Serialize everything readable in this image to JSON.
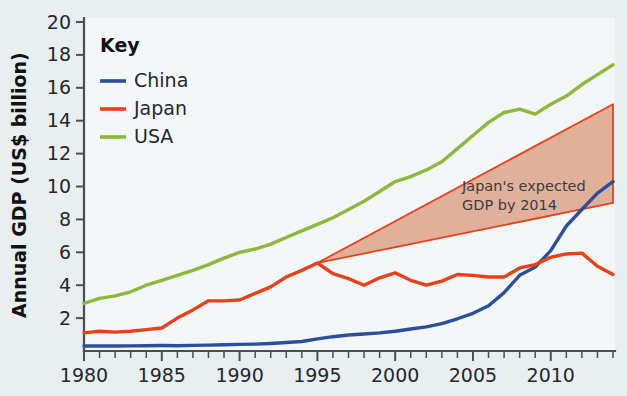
{
  "chart_data": {
    "type": "line",
    "title": "",
    "xlabel": "",
    "ylabel": "Annual GDP (US$ billion)",
    "xlim": [
      1980,
      2014
    ],
    "ylim": [
      0,
      20
    ],
    "grid": false,
    "legend_position": "top-left",
    "legend_title": "Key",
    "x_tick_labels": [
      "1980",
      "1985",
      "1990",
      "1995",
      "2000",
      "2005",
      "2010"
    ],
    "x_tick_values": [
      1980,
      1985,
      1990,
      1995,
      2000,
      2005,
      2010
    ],
    "x_minor_step": 1,
    "y_tick_labels": [
      "2",
      "4",
      "6",
      "8",
      "10",
      "12",
      "14",
      "16",
      "18",
      "20"
    ],
    "y_tick_values": [
      2,
      4,
      6,
      8,
      10,
      12,
      14,
      16,
      18,
      20
    ],
    "x": [
      1980,
      1981,
      1982,
      1983,
      1984,
      1985,
      1986,
      1987,
      1988,
      1989,
      1990,
      1991,
      1992,
      1993,
      1994,
      1995,
      1996,
      1997,
      1998,
      1999,
      2000,
      2001,
      2002,
      2003,
      2004,
      2005,
      2006,
      2007,
      2008,
      2009,
      2010,
      2011,
      2012,
      2013,
      2014
    ],
    "series": [
      {
        "name": "China",
        "color": "#2b4f9e",
        "values": [
          0.3,
          0.3,
          0.3,
          0.31,
          0.32,
          0.33,
          0.32,
          0.34,
          0.36,
          0.38,
          0.4,
          0.42,
          0.46,
          0.52,
          0.58,
          0.74,
          0.87,
          0.97,
          1.03,
          1.1,
          1.2,
          1.34,
          1.47,
          1.66,
          1.96,
          2.29,
          2.75,
          3.55,
          4.6,
          5.1,
          6.1,
          7.6,
          8.6,
          9.6,
          10.3
        ],
        "endpoint_value": 10.3
      },
      {
        "name": "Japan",
        "color": "#e8411a",
        "values": [
          1.1,
          1.2,
          1.15,
          1.2,
          1.3,
          1.4,
          2.0,
          2.5,
          3.05,
          3.05,
          3.1,
          3.5,
          3.9,
          4.5,
          4.9,
          5.35,
          4.7,
          4.4,
          4.0,
          4.45,
          4.75,
          4.3,
          4.0,
          4.25,
          4.65,
          4.6,
          4.5,
          4.5,
          5.05,
          5.25,
          5.7,
          5.9,
          5.95,
          5.15,
          4.65
        ],
        "endpoint_value": 4.65
      },
      {
        "name": "USA",
        "color": "#8cb83c",
        "values": [
          2.9,
          3.2,
          3.35,
          3.6,
          4.0,
          4.3,
          4.6,
          4.9,
          5.25,
          5.65,
          6.0,
          6.2,
          6.5,
          6.9,
          7.3,
          7.7,
          8.1,
          8.6,
          9.1,
          9.7,
          10.3,
          10.6,
          11.0,
          11.5,
          12.3,
          13.1,
          13.9,
          14.5,
          14.7,
          14.4,
          15.0,
          15.5,
          16.2,
          16.8,
          17.4
        ],
        "endpoint_value": 17.4
      }
    ],
    "annotations": [
      {
        "id": "japan-expected-gdp-wedge",
        "text_line_1": "Japan's expected",
        "text_line_2": "GDP by 2014",
        "shape": "wedge",
        "fill_color": "#e0b09b",
        "stroke_color": "#e8411a",
        "apex_year": 1995,
        "apex_value": 5.35,
        "end_year": 2014,
        "end_upper_value": 15.0,
        "end_lower_value": 9.0
      }
    ],
    "colors": {
      "background": "#e9eff0",
      "plot_background": "#f4f7f8",
      "axis": "#4a4f52",
      "china": "#2b4f9e",
      "japan": "#e8411a",
      "usa": "#8cb83c",
      "wedge_fill": "#e0b09b",
      "wedge_stroke": "#e8411a"
    }
  },
  "legend": {
    "title": "Key",
    "items": [
      {
        "label": "China",
        "color": "#2b4f9e"
      },
      {
        "label": "Japan",
        "color": "#e8411a"
      },
      {
        "label": "USA",
        "color": "#8cb83c"
      }
    ]
  },
  "axes": {
    "y_title": "Annual GDP (US$ billion)"
  }
}
